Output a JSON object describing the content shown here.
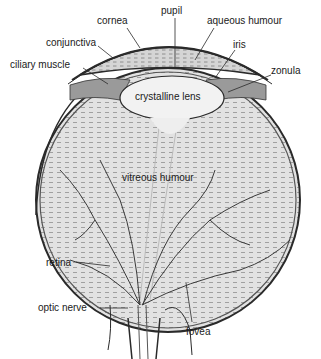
{
  "diagram": {
    "labels": {
      "cornea": "cornea",
      "pupil": "pupil",
      "aqueous_humour": "aqueous humour",
      "conjunctiva": "conjunctiva",
      "iris": "iris",
      "ciliary_muscle": "ciliary muscle",
      "zonula": "zonula",
      "crystalline_lens": "crystalline lens",
      "vitreous_humour": "vitreous humour",
      "retina": "retina",
      "optic_nerve": "optic nerve",
      "fovea": "fovea"
    },
    "colors": {
      "ink": "#2a2a2a",
      "fill": "#d8d8d8",
      "hatch": "#9a9a9a",
      "background": "#ffffff"
    }
  }
}
